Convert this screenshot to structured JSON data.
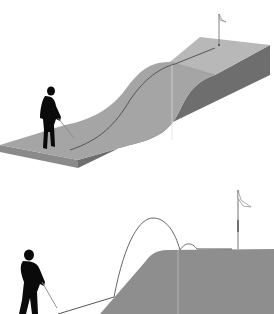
{
  "figure": {
    "colors": {
      "background": "#ffffff",
      "top_surface": "#a9a9a9",
      "upper_plateau": "#b8b8b8",
      "side_face": "#6f6f6f",
      "front_face": "#8a8a8a",
      "golfer": "#0a0a0a",
      "ball_path": "#555555",
      "flag": "#ffffff"
    },
    "panels": [
      {
        "id": "top",
        "label": "putt-up-slope",
        "elements": [
          "golfer",
          "putter",
          "ball-path",
          "slope-block",
          "flagstick",
          "flag"
        ]
      },
      {
        "id": "bottom",
        "label": "chip-onto-raised-green",
        "elements": [
          "golfer",
          "club",
          "ground-roll",
          "arc-trajectory",
          "bounce",
          "raised-green",
          "flagstick",
          "flag"
        ]
      }
    ]
  }
}
